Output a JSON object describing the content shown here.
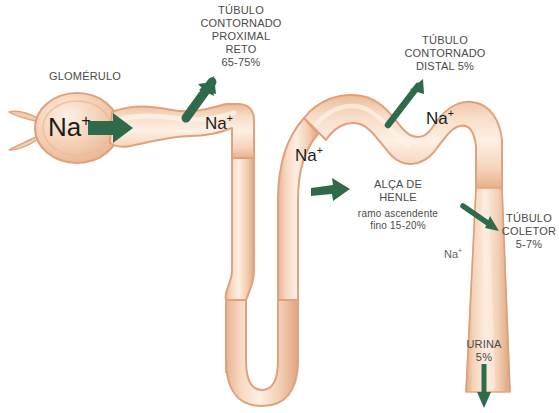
{
  "diagram": {
    "background_color": "#ffffff",
    "colors": {
      "tubule_outline": "#e0a883",
      "tubule_wall": "#f1c4a3",
      "tubule_lumen": "#fbe7d6",
      "arrow_green": "#2f6b4b",
      "label_text": "#4a4a48",
      "na_text": "#1c1c1c"
    }
  },
  "labels": {
    "glomerulus": "GLOMÉRULO",
    "proximal_tubule": "TÚBULO\nCONTORNADO\nPROXIMAL\nRETO\n65-75%",
    "distal_tubule": "TÚBULO\nCONTORNADO\nDISTAL 5%",
    "henle_loop_title": "ALÇA DE\nHENLE",
    "henle_loop_detail": "ramo ascendente\nfino 15-20%",
    "collecting_tubule": "TÚBULO\nCOLETOR\n5-7%",
    "urine": "URINA\n5%"
  },
  "ion_labels": {
    "glomerulus_na": "Na",
    "proximal_na": "Na",
    "descending_na": "Na",
    "distal_na": "Na",
    "collecting_na": "Na",
    "superscript": "+"
  },
  "arrows": [
    {
      "name": "glomerulus-flow-arrow",
      "direction": "right",
      "relates_to": "glomerulus"
    },
    {
      "name": "proximal-reabsorption-arrow",
      "direction": "up-right",
      "relates_to": "proximal_tubule"
    },
    {
      "name": "distal-reabsorption-arrow",
      "direction": "up-right",
      "relates_to": "distal_tubule"
    },
    {
      "name": "henle-reabsorption-arrow",
      "direction": "right",
      "relates_to": "henle_loop"
    },
    {
      "name": "collecting-reabsorption-arrow",
      "direction": "down-right",
      "relates_to": "collecting_tubule"
    },
    {
      "name": "urine-outflow-arrow",
      "direction": "down",
      "relates_to": "urine"
    }
  ]
}
